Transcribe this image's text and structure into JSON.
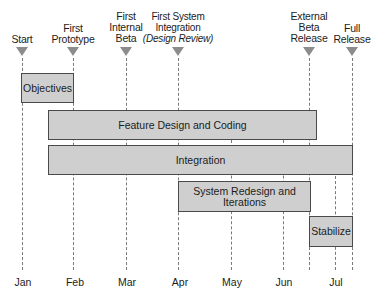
{
  "milestones": [
    {
      "id": "start",
      "lines": [
        "Start"
      ],
      "x": 22
    },
    {
      "id": "first-prototype",
      "lines": [
        "First",
        "Prototype"
      ],
      "x": 73
    },
    {
      "id": "first-internal-beta",
      "lines": [
        "First",
        "Internal",
        "Beta"
      ],
      "x": 126
    },
    {
      "id": "first-system-integration",
      "lines": [
        "First System",
        "Integration",
        "(Design Review)"
      ],
      "x": 178
    },
    {
      "id": "external-beta-release",
      "lines": [
        "External",
        "Beta",
        "Release"
      ],
      "x": 309
    },
    {
      "id": "full-release",
      "lines": [
        "Full",
        "Release"
      ],
      "x": 352
    }
  ],
  "months": [
    {
      "label": "Jan",
      "x": 22
    },
    {
      "label": "Feb",
      "x": 74
    },
    {
      "label": "Mar",
      "x": 126
    },
    {
      "label": "Apr",
      "x": 180
    },
    {
      "label": "May",
      "x": 232
    },
    {
      "label": "Jun",
      "x": 284
    },
    {
      "label": "Jul",
      "x": 335
    }
  ],
  "tasks": [
    {
      "id": "objectives",
      "lines": [
        "Objectives"
      ],
      "start": "Jan",
      "end": "Feb"
    },
    {
      "id": "feature-design-and-coding",
      "lines": [
        "Feature Design and Coding"
      ],
      "start": "mid-Jan",
      "end": "mid-Jun"
    },
    {
      "id": "integration",
      "lines": [
        "Integration"
      ],
      "start": "mid-Jan",
      "end": "Full Release"
    },
    {
      "id": "system-redesign-and-iterations",
      "lines": [
        "System Redesign and",
        "Iterations"
      ],
      "start": "Apr",
      "end": "mid-Jun"
    },
    {
      "id": "stabilize",
      "lines": [
        "Stabilize"
      ],
      "start": "mid-Jun",
      "end": "Full Release"
    }
  ],
  "colors": {
    "bar_fill": "#cfcfcf",
    "bar_border": "#4a4a4a",
    "triangle": "#8c8c8c",
    "gridline": "#7a7a7a"
  }
}
